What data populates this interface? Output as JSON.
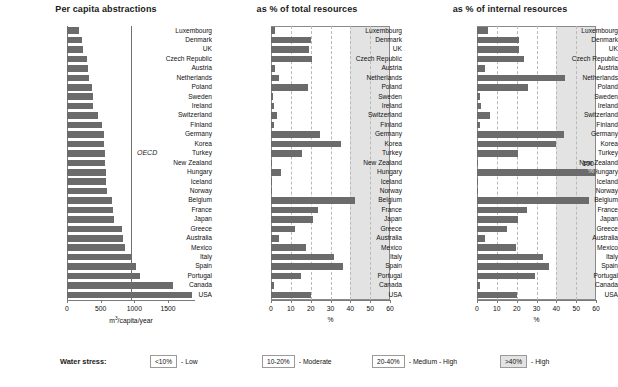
{
  "figure": {
    "width": 618,
    "height": 387,
    "bar_color": "#6b6b6b",
    "shade_color": "#e3e3e3",
    "grid_color": "#b9b9b9"
  },
  "categories": [
    "Luxembourg",
    "Denmark",
    "UK",
    "Czech Republic",
    "Austria",
    "Netherlands",
    "Poland",
    "Sweden",
    "Ireland",
    "Switzerland",
    "Finland",
    "Germany",
    "Korea",
    "Turkey",
    "New Zealand",
    "Hungary",
    "Iceland",
    "Norway",
    "Belgium",
    "France",
    "Japan",
    "Greece",
    "Australia",
    "Mexico",
    "Italy",
    "Spain",
    "Portugal",
    "Canada",
    "USA"
  ],
  "legend": {
    "title": "Water stress:",
    "items": [
      {
        "range": "<10%",
        "label": "- Low",
        "fill": "#ffffff"
      },
      {
        "range": "10-20%",
        "label": "- Moderate",
        "fill": "#ffffff"
      },
      {
        "range": "20-40%",
        "label": "- Medium - High",
        "fill": "#ffffff"
      },
      {
        "range": ">40%",
        "label": "- High",
        "fill": "#e3e3e3"
      }
    ]
  },
  "annotations": {
    "oecd_label": "OECD",
    "hungary_100_value": "100",
    "hungary_100_unit": "%"
  },
  "chart_data": [
    {
      "type": "bar",
      "orientation": "horizontal",
      "title": "Per capita abstractions",
      "xlabel": "m3/capita/year",
      "ylabel": "",
      "xlim": [
        0,
        1900
      ],
      "xticks": [
        0,
        500,
        1000,
        1500
      ],
      "xticklabels": [
        "0",
        "500",
        "1000",
        "1500"
      ],
      "grid": false,
      "reference_line": {
        "label": "OECD",
        "value": 950
      },
      "categories": [
        "Luxembourg",
        "Denmark",
        "UK",
        "Czech Republic",
        "Austria",
        "Netherlands",
        "Poland",
        "Sweden",
        "Ireland",
        "Switzerland",
        "Finland",
        "Germany",
        "Korea",
        "Turkey",
        "New Zealand",
        "Hungary",
        "Iceland",
        "Norway",
        "Belgium",
        "France",
        "Japan",
        "Greece",
        "Australia",
        "Mexico",
        "Italy",
        "Spain",
        "Portugal",
        "Canada",
        "USA"
      ],
      "values": [
        180,
        230,
        235,
        290,
        310,
        320,
        375,
        380,
        385,
        460,
        525,
        545,
        555,
        565,
        570,
        575,
        580,
        595,
        675,
        680,
        700,
        810,
        830,
        860,
        960,
        1030,
        1080,
        1580,
        1850
      ]
    },
    {
      "type": "bar",
      "orientation": "horizontal",
      "title": "as % of total resources",
      "xlabel": "%",
      "ylabel": "",
      "xlim": [
        0,
        60
      ],
      "xticks": [
        0,
        10,
        20,
        30,
        40,
        50,
        60
      ],
      "xticklabels": [
        "0",
        "10",
        "20",
        "30",
        "40",
        "50",
        "60"
      ],
      "grid": true,
      "shaded_region": {
        "from": 40,
        "to": 60,
        "meaning": ">40% - High"
      },
      "categories": [
        "Luxembourg",
        "Denmark",
        "UK",
        "Czech Republic",
        "Austria",
        "Netherlands",
        "Poland",
        "Sweden",
        "Ireland",
        "Switzerland",
        "Finland",
        "Germany",
        "Korea",
        "Turkey",
        "New Zealand",
        "Hungary",
        "Iceland",
        "Norway",
        "Belgium",
        "France",
        "Japan",
        "Greece",
        "Australia",
        "Mexico",
        "Italy",
        "Spain",
        "Portugal",
        "Canada",
        "USA"
      ],
      "values": [
        2.0,
        20.0,
        19.0,
        20.5,
        2.0,
        4.0,
        18.5,
        1.0,
        1.5,
        3.0,
        1.5,
        24.5,
        35.5,
        15.5,
        0.5,
        5.0,
        0.1,
        0.5,
        42.5,
        23.5,
        21.0,
        12.0,
        4.0,
        17.5,
        32.0,
        36.5,
        15.0,
        1.5,
        20.0
      ]
    },
    {
      "type": "bar",
      "orientation": "horizontal",
      "title": "as % of internal resources",
      "xlabel": "%",
      "ylabel": "",
      "xlim": [
        0,
        60
      ],
      "xticks": [
        0,
        10,
        20,
        30,
        40,
        50,
        60
      ],
      "xticklabels": [
        "0",
        "10",
        "20",
        "30",
        "40",
        "50",
        "60"
      ],
      "grid": true,
      "shaded_region": {
        "from": 40,
        "to": 60,
        "meaning": ">40% - High"
      },
      "categories": [
        "Luxembourg",
        "Denmark",
        "UK",
        "Czech Republic",
        "Austria",
        "Netherlands",
        "Poland",
        "Sweden",
        "Ireland",
        "Switzerland",
        "Finland",
        "Germany",
        "Korea",
        "Turkey",
        "New Zealand",
        "Hungary",
        "Iceland",
        "Norway",
        "Belgium",
        "France",
        "Japan",
        "Greece",
        "Australia",
        "Mexico",
        "Italy",
        "Spain",
        "Portugal",
        "Canada",
        "USA"
      ],
      "values": [
        5.5,
        21.0,
        21.0,
        23.5,
        4.0,
        44.5,
        25.5,
        1.5,
        2.0,
        6.5,
        1.5,
        44.0,
        40.0,
        20.5,
        0.5,
        100.0,
        0.1,
        0.5,
        56.5,
        25.0,
        20.5,
        15.0,
        4.0,
        19.5,
        33.5,
        36.5,
        29.0,
        1.5,
        20.0
      ]
    }
  ],
  "panel_layout": [
    {
      "left": 0,
      "width": 212,
      "plot_left": 67,
      "plot_width": 128,
      "shaded": false,
      "boxed": false
    },
    {
      "left": 212,
      "width": 190,
      "plot_left": 59,
      "plot_width": 119,
      "shaded": true,
      "boxed": true
    },
    {
      "left": 402,
      "width": 216,
      "plot_left": 75,
      "plot_width": 119,
      "shaded": true,
      "boxed": true
    }
  ]
}
